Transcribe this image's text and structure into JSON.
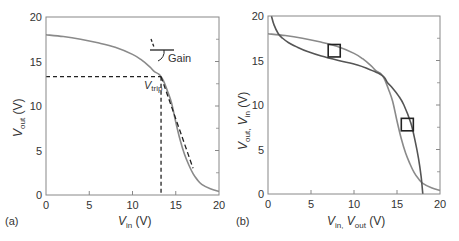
{
  "colors": {
    "axis": "#888888",
    "curve_gray": "#8a8a8a",
    "curve_dark": "#555555",
    "annotation": "#222222",
    "text": "#333333"
  },
  "chart_data": [
    {
      "type": "line",
      "panel_label": "(a)",
      "title": "",
      "xlabel": "V_in (V)",
      "ylabel": "V_out (V)",
      "xlabel_main": "V",
      "xlabel_sub": "in",
      "xlabel_unit": " (V)",
      "ylabel_main": "V",
      "ylabel_sub": "out",
      "ylabel_unit": " (V)",
      "xlim": [
        0,
        20
      ],
      "ylim": [
        0,
        20
      ],
      "xticks": [
        0,
        5,
        10,
        15,
        20
      ],
      "yticks": [
        0,
        5,
        10,
        15,
        20
      ],
      "xtick_labels": [
        "0",
        "5",
        "10",
        "15",
        "20"
      ],
      "ytick_labels": [
        "0",
        "5",
        "10",
        "15",
        "20"
      ],
      "grid": false,
      "series": [
        {
          "name": "transfer curve",
          "x": [
            0,
            2,
            4,
            6,
            8,
            10,
            11,
            12,
            12.5,
            13,
            13.3,
            13.6,
            14,
            14.5,
            15,
            15.5,
            16,
            16.5,
            17,
            17.5,
            18,
            19,
            20
          ],
          "y": [
            18.0,
            17.8,
            17.5,
            17.1,
            16.6,
            15.8,
            15.2,
            14.4,
            13.9,
            13.6,
            13.3,
            12.8,
            11.8,
            10.4,
            8.2,
            6.2,
            4.6,
            3.4,
            2.4,
            1.7,
            1.2,
            0.7,
            0.4
          ]
        },
        {
          "name": "gain tangent (dashed)",
          "x": [
            13.3,
            17.0
          ],
          "y": [
            13.3,
            3.0
          ]
        }
      ],
      "annotations": [
        {
          "text": "Gain",
          "x": 14.5,
          "y": 15.2
        },
        {
          "text": "V_trip",
          "main": "V",
          "sub": "trip",
          "x": 12.2,
          "y": 11.9
        },
        {
          "type": "dashed-guide",
          "description": "horizontal from (0, 13.3) to (13.3, 13.3) and vertical from (13.3, 13.3) to (13.3, 0)"
        }
      ],
      "legend": null
    },
    {
      "type": "line",
      "panel_label": "(b)",
      "title": "",
      "xlabel": "V_in, V_out (V)",
      "ylabel": "V_out, V_in (V)",
      "xlabel_parts": [
        {
          "main": "V",
          "sub": "in,"
        },
        {
          "main": " V",
          "sub": "out"
        },
        {
          "main": " (V)",
          "sub": ""
        }
      ],
      "ylabel_parts": [
        {
          "main": "V",
          "sub": "out,"
        },
        {
          "main": " V",
          "sub": "in"
        },
        {
          "main": " (V)",
          "sub": ""
        }
      ],
      "xlim": [
        0,
        20
      ],
      "ylim": [
        0,
        20
      ],
      "xticks": [
        0,
        5,
        10,
        15,
        20
      ],
      "yticks": [
        0,
        5,
        10,
        15,
        20
      ],
      "xtick_labels": [
        "0",
        "5",
        "10",
        "15",
        "20"
      ],
      "ytick_labels": [
        "0",
        "5",
        "10",
        "15",
        "20"
      ],
      "grid": false,
      "series": [
        {
          "name": "V_out vs V_in (butterfly curve 1)",
          "x": [
            0,
            2,
            4,
            6,
            8,
            10,
            11,
            12,
            12.5,
            13,
            13.3,
            13.6,
            14,
            14.5,
            15,
            15.5,
            16,
            16.5,
            17,
            17.5,
            18,
            19,
            20
          ],
          "y": [
            18.0,
            17.8,
            17.5,
            17.1,
            16.6,
            15.8,
            15.2,
            14.4,
            13.9,
            13.6,
            13.3,
            12.8,
            11.8,
            10.4,
            8.2,
            6.2,
            4.6,
            3.4,
            2.4,
            1.7,
            1.2,
            0.7,
            0.4
          ]
        },
        {
          "name": "V_in vs V_out (mirrored curve 2)",
          "x": [
            18.0,
            17.8,
            17.5,
            17.1,
            16.6,
            15.8,
            15.2,
            14.4,
            13.9,
            13.6,
            13.3,
            12.8,
            11.8,
            10.4,
            8.2,
            6.2,
            4.6,
            3.4,
            2.4,
            1.7,
            1.2,
            0.7,
            0.4
          ],
          "y": [
            0,
            2,
            4,
            6,
            8,
            10,
            11,
            12,
            12.5,
            13,
            13.3,
            13.6,
            14,
            14.5,
            15,
            15.5,
            16,
            16.5,
            17,
            17.5,
            18,
            19,
            20
          ]
        }
      ],
      "annotations": [
        {
          "type": "square-marker",
          "description": "noise-margin square, upper-left eye",
          "x_range": [
            7.0,
            8.4
          ],
          "y_range": [
            15.4,
            16.8
          ]
        },
        {
          "type": "square-marker",
          "description": "noise-margin square, lower-right eye",
          "x_range": [
            15.5,
            16.9
          ],
          "y_range": [
            7.1,
            8.5
          ]
        }
      ],
      "legend": null
    }
  ]
}
